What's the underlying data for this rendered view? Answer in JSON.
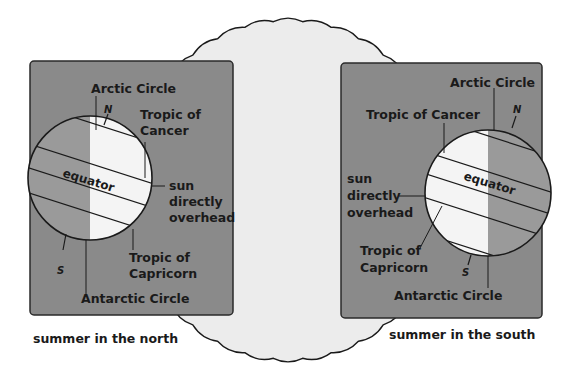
{
  "figure": {
    "sun_label": "",
    "left_panel": {
      "caption": "summer in the north",
      "labels": {
        "arctic": "Arctic Circle",
        "north": "N",
        "cancer_1": "Tropic of",
        "cancer_2": "Cancer",
        "equator": "equator",
        "sun_1": "sun",
        "sun_2": "directly",
        "sun_3": "overhead",
        "capricorn_1": "Tropic of",
        "capricorn_2": "Capricorn",
        "south": "S",
        "antarctic": "Antarctic Circle"
      }
    },
    "right_panel": {
      "caption": "summer in the south",
      "labels": {
        "arctic": "Arctic Circle",
        "north": "N",
        "cancer": "Tropic of Cancer",
        "equator": "equator",
        "sun_1": "sun",
        "sun_2": "directly",
        "sun_3": "overhead",
        "capricorn_1": "Tropic of",
        "capricorn_2": "Capricorn",
        "south": "S",
        "antarctic": "Antarctic Circle"
      }
    },
    "colors": {
      "panel": "#8a8a8a",
      "night": "#9a9a9a",
      "day": "#f4f4f4",
      "sun": "#ececec",
      "ink": "#1a1a1a"
    }
  }
}
